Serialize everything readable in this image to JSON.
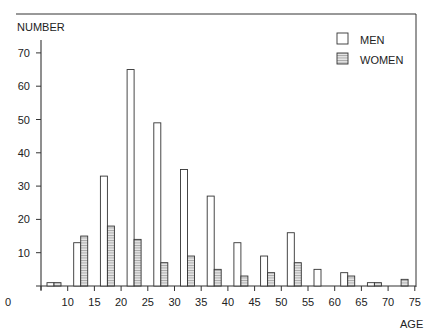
{
  "chart_data": {
    "type": "bar",
    "title": "",
    "xlabel": "AGE",
    "ylabel": "NUMBER",
    "ylim": [
      0,
      75
    ],
    "xlim": [
      5,
      75
    ],
    "grid": false,
    "legend_position": "top-right",
    "y_ticks": [
      10,
      20,
      30,
      40,
      50,
      60,
      70
    ],
    "x_ticks": [
      0,
      10,
      15,
      20,
      25,
      30,
      35,
      40,
      45,
      50,
      55,
      60,
      65,
      70,
      75
    ],
    "categories": [
      "5-9",
      "10-14",
      "15-19",
      "20-24",
      "25-29",
      "30-34",
      "35-39",
      "40-44",
      "45-49",
      "50-54",
      "55-59",
      "60-64",
      "65-69",
      "70-74"
    ],
    "category_start": [
      5,
      10,
      15,
      20,
      25,
      30,
      35,
      40,
      45,
      50,
      55,
      60,
      65,
      70
    ],
    "series": [
      {
        "name": "MEN",
        "fill": "#ffffff",
        "hatched": false,
        "values": [
          1,
          13,
          33,
          65,
          49,
          35,
          27,
          13,
          9,
          16,
          5,
          4,
          1,
          0
        ]
      },
      {
        "name": "WOMEN",
        "fill": "#d9d9d9",
        "hatched": true,
        "values": [
          1,
          15,
          18,
          14,
          7,
          9,
          5,
          3,
          4,
          7,
          0,
          3,
          1,
          2
        ]
      }
    ]
  },
  "legend": {
    "men": "MEN",
    "women": "WOMEN"
  },
  "axes": {
    "y_title": "NUMBER",
    "x_title": "AGE"
  }
}
